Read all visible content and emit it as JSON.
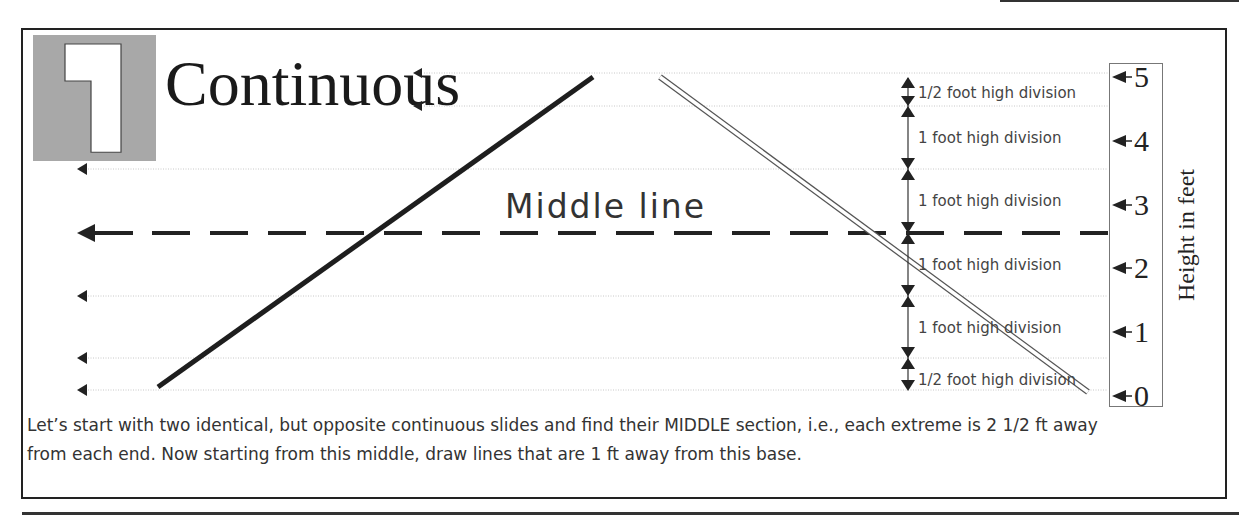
{
  "section": {
    "number": "1",
    "title": "Continuous"
  },
  "diagram": {
    "middle_label": "Middle line",
    "divisions": [
      {
        "label": "1/2 foot high division"
      },
      {
        "label": "1 foot high division"
      },
      {
        "label": "1 foot high division"
      },
      {
        "label": "1 foot high division"
      },
      {
        "label": "1 foot high division"
      },
      {
        "label": "1/2 foot high division"
      }
    ],
    "scale": {
      "axis_title": "Height in feet",
      "ticks": [
        "5",
        "4",
        "3",
        "2",
        "1",
        "0"
      ]
    },
    "icons": {
      "left_arrows": "arrow-left-icon",
      "division_markers": "double-arrow-icon"
    }
  },
  "caption": "Let’s start with two identical, but opposite continuous slides and find their MIDDLE section, i.e., each extreme is 2 1/2 ft away from each end. Now starting from this middle, draw lines that are 1 ft away from this base."
}
